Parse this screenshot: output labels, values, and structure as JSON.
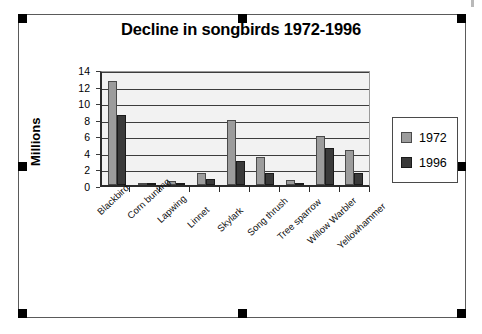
{
  "document": {
    "selection_handles": [
      "top-left",
      "top-center",
      "top-right",
      "middle-left",
      "middle-right",
      "bottom-left",
      "bottom-center",
      "bottom-right"
    ]
  },
  "legend": {
    "position": "right",
    "entries": [
      {
        "label": "1972",
        "color": "#9c9c9c"
      },
      {
        "label": "1996",
        "color": "#3a3a3a"
      }
    ]
  },
  "axes": {
    "y_title": "Millions",
    "y_ticks": [
      "0",
      "2",
      "4",
      "6",
      "8",
      "10",
      "12",
      "14"
    ]
  },
  "chart_data": {
    "type": "bar",
    "title": "Decline in songbirds 1972-1996",
    "xlabel": "",
    "ylabel": "Millions",
    "ylim": [
      0,
      14
    ],
    "ytick_step": 2,
    "grid": true,
    "legend_position": "right",
    "categories": [
      "Blackbird",
      "Corn bunting",
      "Lapwing",
      "Linnet",
      "Skylark",
      "Song thrush",
      "Tree sparrow",
      "Willow Warbler",
      "Yellowhammer"
    ],
    "series": [
      {
        "name": "1972",
        "color": "#9c9c9c",
        "values": [
          12.5,
          0.2,
          0.5,
          1.4,
          7.9,
          3.4,
          0.6,
          5.9,
          4.2
        ]
      },
      {
        "name": "1996",
        "color": "#3a3a3a",
        "values": [
          8.5,
          0.1,
          0.3,
          0.7,
          2.9,
          1.5,
          0.1,
          4.5,
          1.4
        ]
      }
    ]
  }
}
